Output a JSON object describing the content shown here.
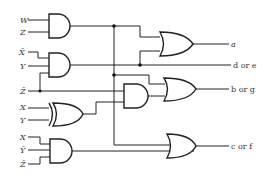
{
  "diagram": {
    "type": "logic-circuit",
    "inputs": {
      "g1": [
        "W",
        "Z"
      ],
      "g2": [
        "X̄",
        "Y"
      ],
      "zbar": "Z̄",
      "g3": [
        "X",
        "Y"
      ],
      "g4": [
        "X",
        "Ȳ",
        "Z̄"
      ]
    },
    "outputs": {
      "a": "a",
      "de": "d or e",
      "bg": "b or g",
      "cf": "c or f"
    },
    "gates": [
      {
        "id": "and1",
        "type": "AND",
        "inputs": [
          "W",
          "Z"
        ]
      },
      {
        "id": "and2",
        "type": "AND",
        "inputs": [
          "X̄",
          "Y",
          "Z̄"
        ]
      },
      {
        "id": "xor1",
        "type": "XOR",
        "inputs": [
          "X",
          "Y"
        ]
      },
      {
        "id": "and3",
        "type": "AND",
        "inputs": [
          "Z̄",
          "xor1"
        ]
      },
      {
        "id": "and4",
        "type": "AND",
        "inputs": [
          "X",
          "Ȳ",
          "Z̄"
        ]
      },
      {
        "id": "or_a",
        "type": "OR",
        "inputs": [
          "and1",
          "and2"
        ],
        "output": "a"
      },
      {
        "id": "or_bg",
        "type": "OR",
        "inputs": [
          "and1",
          "and3"
        ],
        "output": "b or g"
      },
      {
        "id": "or_cf",
        "type": "OR",
        "inputs": [
          "and1",
          "and4"
        ],
        "output": "c or f"
      }
    ]
  }
}
